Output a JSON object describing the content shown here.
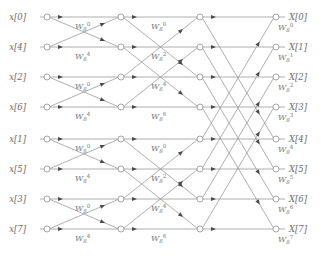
{
  "figure": {
    "name": "8-point radix-2 decimation-in-time FFT signal flow graph",
    "background_color": "#ffffff",
    "line_color": "#9a9a9a",
    "node_fill": "#ffffff",
    "node_stroke": "#8f8f8f",
    "arrow_color": "#4a4a4a",
    "text_color": "#6b6b6b"
  },
  "chart_data": {
    "type": "diagram",
    "title": "",
    "n_points": 8,
    "stages": 3,
    "radix": 2,
    "algorithm": "decimation-in-time",
    "input_order": "bit-reversed",
    "output_order": "natural",
    "inputs": [
      {
        "label": "x[0]",
        "row": 0
      },
      {
        "label": "x[4]",
        "row": 1
      },
      {
        "label": "x[2]",
        "row": 2
      },
      {
        "label": "x[6]",
        "row": 3
      },
      {
        "label": "x[1]",
        "row": 4
      },
      {
        "label": "x[5]",
        "row": 5
      },
      {
        "label": "x[3]",
        "row": 6
      },
      {
        "label": "x[7]",
        "row": 7
      }
    ],
    "outputs": [
      {
        "label": "X[0]",
        "row": 0
      },
      {
        "label": "X[1]",
        "row": 1
      },
      {
        "label": "X[2]",
        "row": 2
      },
      {
        "label": "X[3]",
        "row": 3
      },
      {
        "label": "X[4]",
        "row": 4
      },
      {
        "label": "X[5]",
        "row": 5
      },
      {
        "label": "X[6]",
        "row": 6
      },
      {
        "label": "X[7]",
        "row": 7
      }
    ],
    "twiddle_base": "W",
    "twiddle_subscript": "8",
    "stage_1": {
      "span": 1,
      "twiddles": [
        {
          "row": 0,
          "exponent": "0",
          "label": "W8^0"
        },
        {
          "row": 1,
          "exponent": "4",
          "label": "W8^4"
        },
        {
          "row": 2,
          "exponent": "0",
          "label": "W8^0"
        },
        {
          "row": 3,
          "exponent": "4",
          "label": "W8^4"
        },
        {
          "row": 4,
          "exponent": "0",
          "label": "W8^0"
        },
        {
          "row": 5,
          "exponent": "4",
          "label": "W8^4"
        },
        {
          "row": 6,
          "exponent": "0",
          "label": "W8^0"
        },
        {
          "row": 7,
          "exponent": "4",
          "label": "W8^4"
        }
      ]
    },
    "stage_2": {
      "span": 2,
      "twiddles": [
        {
          "row": 0,
          "exponent": "0",
          "label": "W8^0"
        },
        {
          "row": 1,
          "exponent": "2",
          "label": "W8^2"
        },
        {
          "row": 2,
          "exponent": "4",
          "label": "W8^4"
        },
        {
          "row": 3,
          "exponent": "6",
          "label": "W8^6"
        },
        {
          "row": 4,
          "exponent": "0",
          "label": "W8^0"
        },
        {
          "row": 5,
          "exponent": "2",
          "label": "W8^2"
        },
        {
          "row": 6,
          "exponent": "4",
          "label": "W8^4"
        },
        {
          "row": 7,
          "exponent": "6",
          "label": "W8^6"
        }
      ]
    },
    "stage_3": {
      "span": 4,
      "twiddles": [
        {
          "row": 0,
          "exponent": "0",
          "label": "W8^0"
        },
        {
          "row": 1,
          "exponent": "1",
          "label": "W8^1"
        },
        {
          "row": 2,
          "exponent": "2",
          "label": "W8^2"
        },
        {
          "row": 3,
          "exponent": "3",
          "label": "W8^3"
        },
        {
          "row": 4,
          "exponent": "4",
          "label": "W8^4"
        },
        {
          "row": 5,
          "exponent": "5",
          "label": "W8^5"
        },
        {
          "row": 6,
          "exponent": "6",
          "label": "W8^6"
        },
        {
          "row": 7,
          "exponent": "7",
          "label": "W8^7"
        }
      ]
    },
    "geometry": {
      "node_columns_x": [
        47,
        121,
        200,
        276
      ],
      "row_y": [
        17,
        47,
        77,
        107,
        139,
        169,
        199,
        229
      ],
      "input_label_x": 26,
      "output_label_x": 289,
      "node_radius": 3.0
    }
  }
}
